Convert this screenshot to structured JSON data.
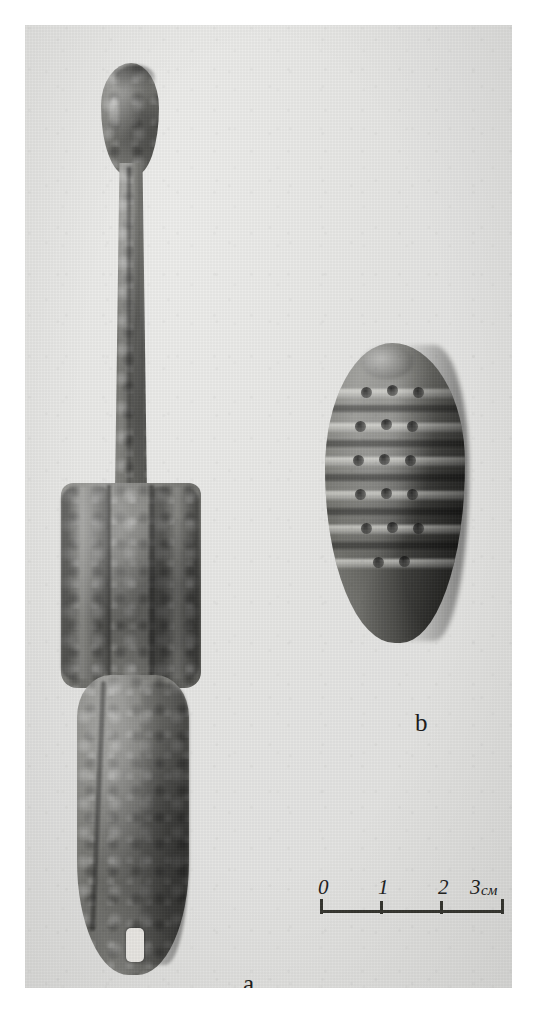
{
  "plate": {
    "kind": "archaeological-photo-plate",
    "background_color": "#ffffff",
    "photo_tone": "#e6e6e4"
  },
  "figures": [
    {
      "id": "a",
      "label": "a",
      "description": "elongated cast bronze pin / shafted implement with bulbous head, narrow shaft, winged mid-section and flat lower blade pierced by a rectangular slot",
      "position": "left"
    },
    {
      "id": "b",
      "label": "b",
      "description": "ovoid bronze bead or pendant decorated with horizontal bands and rows of punched dots",
      "position": "right"
    }
  ],
  "scale_bar": {
    "ticks": [
      "0",
      "1",
      "2",
      "3"
    ],
    "unit": "см",
    "unit_label_combined": "3см",
    "divisions": 3,
    "line_color": "#35352f"
  }
}
